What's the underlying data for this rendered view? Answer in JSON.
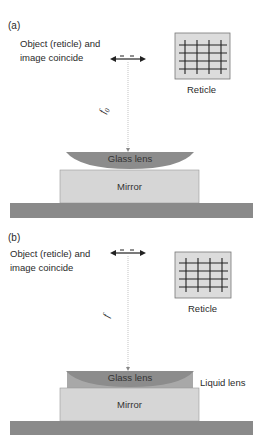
{
  "panels": [
    {
      "id": "a",
      "label": "(a)",
      "caption_line1": "Object (reticle) and",
      "caption_line2": "image coincide",
      "reticle_label": "Reticle",
      "distance_label": "f0",
      "distance_symbol": "f",
      "distance_subscript": "0",
      "lens_label": "Glass lens",
      "mirror_label": "Mirror"
    },
    {
      "id": "b",
      "label": "(b)",
      "caption_line1": "Object (reticle) and",
      "caption_line2": "image coincide",
      "reticle_label": "Reticle",
      "distance_label": "f",
      "distance_symbol": "f",
      "lens_label": "Glass lens",
      "liquid_lens_label": "Liquid lens",
      "mirror_label": "Mirror"
    }
  ],
  "colors": {
    "glass_lens": "#8c8c8c",
    "liquid_lens": "#a8a8a8",
    "mirror": "#d6d6d6",
    "base": "#8a8a8a",
    "reticle_bg": "#dcdcdc",
    "line": "#333333"
  }
}
